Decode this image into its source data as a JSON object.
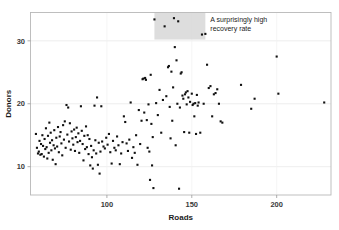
{
  "chart_data": {
    "type": "scatter",
    "title": "",
    "xlabel": "Roads",
    "ylabel": "Donors",
    "xlim": [
      55,
      232
    ],
    "ylim": [
      5.5,
      34.5
    ],
    "xticks": [
      50,
      100,
      150,
      200
    ],
    "yticks": [
      10,
      20,
      30
    ],
    "xtick_labels": [
      "50",
      "100",
      "150",
      "200"
    ],
    "ytick_labels": [
      "10",
      "20",
      "30"
    ],
    "grid": true,
    "grid_axis": "y",
    "legend": null,
    "marker": "square",
    "marker_color": "#111111",
    "marker_size": 2.1,
    "background_color": "#ffffff",
    "frame_color": "#b8b8b8",
    "gridline_color": "#e6e6e6",
    "annotations": [
      {
        "name": "recovery-rate-callout",
        "text_line_1": "A surprisingly high",
        "text_line_2": "recovery rate",
        "highlight_color": "#d4d4d4",
        "highlight_x_range": [
          128,
          158
        ],
        "highlight_y_range": [
          30.2,
          34.5
        ]
      }
    ],
    "points": [
      [
        58.2,
        15.2
      ],
      [
        58.8,
        13.0
      ],
      [
        59.4,
        12.1
      ],
      [
        59.9,
        12.4
      ],
      [
        60.3,
        14.1
      ],
      [
        60.8,
        11.9
      ],
      [
        61.2,
        13.6
      ],
      [
        61.6,
        12.0
      ],
      [
        62.0,
        15.0
      ],
      [
        62.4,
        13.3
      ],
      [
        62.9,
        11.6
      ],
      [
        63.3,
        14.4
      ],
      [
        63.7,
        12.8
      ],
      [
        64.1,
        16.1
      ],
      [
        64.5,
        13.1
      ],
      [
        64.9,
        11.3
      ],
      [
        65.3,
        14.9
      ],
      [
        65.7,
        12.2
      ],
      [
        66.1,
        17.0
      ],
      [
        66.5,
        13.8
      ],
      [
        66.9,
        15.4
      ],
      [
        67.3,
        12.6
      ],
      [
        67.7,
        14.2
      ],
      [
        68.1,
        11.1
      ],
      [
        68.6,
        13.4
      ],
      [
        69.0,
        15.8
      ],
      [
        69.4,
        12.9
      ],
      [
        69.8,
        10.4
      ],
      [
        70.2,
        14.6
      ],
      [
        70.7,
        13.2
      ],
      [
        71.2,
        16.3
      ],
      [
        71.7,
        12.3
      ],
      [
        72.2,
        14.8
      ],
      [
        72.7,
        15.5
      ],
      [
        73.2,
        13.7
      ],
      [
        73.7,
        11.8
      ],
      [
        74.2,
        16.6
      ],
      [
        74.7,
        14.3
      ],
      [
        75.2,
        17.2
      ],
      [
        75.7,
        13.0
      ],
      [
        76.2,
        19.8
      ],
      [
        76.7,
        15.1
      ],
      [
        77.2,
        19.4
      ],
      [
        77.7,
        14.0
      ],
      [
        78.2,
        16.9
      ],
      [
        78.7,
        12.7
      ],
      [
        79.2,
        15.6
      ],
      [
        79.7,
        14.5
      ],
      [
        80.2,
        13.5
      ],
      [
        80.7,
        15.9
      ],
      [
        81.2,
        12.5
      ],
      [
        81.7,
        14.7
      ],
      [
        82.2,
        16.2
      ],
      [
        82.7,
        13.9
      ],
      [
        83.2,
        15.3
      ],
      [
        83.7,
        12.2
      ],
      [
        84.2,
        14.1
      ],
      [
        84.7,
        19.6
      ],
      [
        85.2,
        15.7
      ],
      [
        85.7,
        13.6
      ],
      [
        86.2,
        11.0
      ],
      [
        86.7,
        14.9
      ],
      [
        87.2,
        12.8
      ],
      [
        87.7,
        16.4
      ],
      [
        88.2,
        13.1
      ],
      [
        88.7,
        15.0
      ],
      [
        89.2,
        12.0
      ],
      [
        89.7,
        14.4
      ],
      [
        90.2,
        10.2
      ],
      [
        90.7,
        13.3
      ],
      [
        91.2,
        11.5
      ],
      [
        91.7,
        9.7
      ],
      [
        92.2,
        12.6
      ],
      [
        92.7,
        19.7
      ],
      [
        93.2,
        14.2
      ],
      [
        93.7,
        12.1
      ],
      [
        94.2,
        21.0
      ],
      [
        94.7,
        10.3
      ],
      [
        95.2,
        13.8
      ],
      [
        95.7,
        8.9
      ],
      [
        96.2,
        12.4
      ],
      [
        96.7,
        19.6
      ],
      [
        97.2,
        14.0
      ],
      [
        98.0,
        13.2
      ],
      [
        98.8,
        12.9
      ],
      [
        99.6,
        14.6
      ],
      [
        100.4,
        13.5
      ],
      [
        101.2,
        15.2
      ],
      [
        102.0,
        12.3
      ],
      [
        102.8,
        10.5
      ],
      [
        103.6,
        14.1
      ],
      [
        104.4,
        13.0
      ],
      [
        105.2,
        12.6
      ],
      [
        106.0,
        14.8
      ],
      [
        106.8,
        13.4
      ],
      [
        107.6,
        10.4
      ],
      [
        108.4,
        12.1
      ],
      [
        109.2,
        13.9
      ],
      [
        110.0,
        18.0
      ],
      [
        110.8,
        17.1
      ],
      [
        111.6,
        13.7
      ],
      [
        112.4,
        12.5
      ],
      [
        113.2,
        14.3
      ],
      [
        114.0,
        20.2
      ],
      [
        114.8,
        11.4
      ],
      [
        115.6,
        13.1
      ],
      [
        116.4,
        12.2
      ],
      [
        117.2,
        15.0
      ],
      [
        118.0,
        10.3
      ],
      [
        118.8,
        19.0
      ],
      [
        119.6,
        13.6
      ],
      [
        120.4,
        17.3
      ],
      [
        121.0,
        23.9
      ],
      [
        121.5,
        24.0
      ],
      [
        122.0,
        18.6
      ],
      [
        122.5,
        24.1
      ],
      [
        123.0,
        23.8
      ],
      [
        123.5,
        17.4
      ],
      [
        124.0,
        13.0
      ],
      [
        124.5,
        19.9
      ],
      [
        125.0,
        12.4
      ],
      [
        125.4,
        7.9
      ],
      [
        125.8,
        24.6
      ],
      [
        126.2,
        16.8
      ],
      [
        126.6,
        10.2
      ],
      [
        127.0,
        14.7
      ],
      [
        127.4,
        6.6
      ],
      [
        128.0,
        33.4
      ],
      [
        129.0,
        20.1
      ],
      [
        130.0,
        18.2
      ],
      [
        131.0,
        22.2
      ],
      [
        132.0,
        15.4
      ],
      [
        133.0,
        20.6
      ],
      [
        134.0,
        32.3
      ],
      [
        135.0,
        21.2
      ],
      [
        136.0,
        25.8
      ],
      [
        136.5,
        26.0
      ],
      [
        137.0,
        19.5
      ],
      [
        137.5,
        14.5
      ],
      [
        138.0,
        25.1
      ],
      [
        138.5,
        17.3
      ],
      [
        139.0,
        22.6
      ],
      [
        139.5,
        33.6
      ],
      [
        140.0,
        29.0
      ],
      [
        140.5,
        13.4
      ],
      [
        141.0,
        26.9
      ],
      [
        141.5,
        20.0
      ],
      [
        142.0,
        33.1
      ],
      [
        142.5,
        6.5
      ],
      [
        143.0,
        19.4
      ],
      [
        143.5,
        24.8
      ],
      [
        144.0,
        25.0
      ],
      [
        144.5,
        21.3
      ],
      [
        145.0,
        20.8
      ],
      [
        145.5,
        15.5
      ],
      [
        146.0,
        21.5
      ],
      [
        146.5,
        21.8
      ],
      [
        147.0,
        19.9
      ],
      [
        147.5,
        22.0
      ],
      [
        148.0,
        21.0
      ],
      [
        148.5,
        15.4
      ],
      [
        149.0,
        20.3
      ],
      [
        150.0,
        21.6
      ],
      [
        150.5,
        19.8
      ],
      [
        151.0,
        20.0
      ],
      [
        151.5,
        18.0
      ],
      [
        152.0,
        20.1
      ],
      [
        152.5,
        15.2
      ],
      [
        153.0,
        21.4
      ],
      [
        153.5,
        19.7
      ],
      [
        154.0,
        20.2
      ],
      [
        155.0,
        15.4
      ],
      [
        156.0,
        31.0
      ],
      [
        157.0,
        20.0
      ],
      [
        158.0,
        31.1
      ],
      [
        159.0,
        26.2
      ],
      [
        160.0,
        22.5
      ],
      [
        161.0,
        22.8
      ],
      [
        162.0,
        18.0
      ],
      [
        163.0,
        21.5
      ],
      [
        164.0,
        21.7
      ],
      [
        165.0,
        22.3
      ],
      [
        166.0,
        20.0
      ],
      [
        167.0,
        17.2
      ],
      [
        168.0,
        17.0
      ],
      [
        179.0,
        23.0
      ],
      [
        185.0,
        19.2
      ],
      [
        187.0,
        20.8
      ],
      [
        200.0,
        27.5
      ],
      [
        201.0,
        21.6
      ],
      [
        228.0,
        20.2
      ]
    ]
  }
}
